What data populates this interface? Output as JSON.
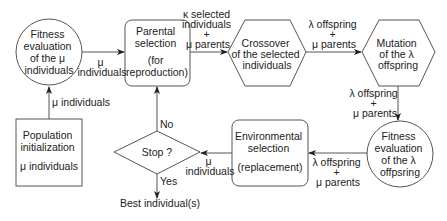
{
  "diagram": {
    "type": "flowchart",
    "nodes": {
      "fitness_mu": {
        "shape": "circle",
        "lines": [
          "Fitness",
          "evaluation",
          "of the μ",
          "individuals"
        ]
      },
      "parental": {
        "shape": "rounded-rect",
        "lines": [
          "Parental",
          "selection",
          "",
          "(for",
          "reproduction)"
        ]
      },
      "crossover": {
        "shape": "hexagon",
        "lines": [
          "Crossover",
          "of the selected",
          "individuals"
        ]
      },
      "mutation": {
        "shape": "hexagon",
        "lines": [
          "Mutation",
          "of the λ",
          "offspring"
        ]
      },
      "fitness_lambda": {
        "shape": "circle",
        "lines": [
          "Fitness",
          "evaluation",
          "of the λ",
          "offpsring"
        ]
      },
      "environmental": {
        "shape": "rounded-rect",
        "lines": [
          "Environmental",
          "selection",
          "",
          "(replacement)"
        ]
      },
      "stop": {
        "shape": "diamond",
        "lines": [
          "Stop ?"
        ]
      },
      "init": {
        "shape": "rect",
        "lines": [
          "Population",
          "initialization",
          "",
          "μ individuals"
        ]
      }
    },
    "edges": {
      "init_to_fitness": {
        "lines": [
          "μ individuals"
        ]
      },
      "fitness_to_parental": {
        "lines": [
          "μ",
          "individuals"
        ]
      },
      "parental_to_crossover": {
        "lines": [
          "κ selected",
          "individuals",
          "+",
          "μ parents"
        ]
      },
      "crossover_to_mutation": {
        "lines": [
          "λ offspring",
          "+",
          "μ parents"
        ]
      },
      "mutation_to_fitness": {
        "lines": [
          "λ offspring",
          "+",
          "μ parents"
        ]
      },
      "fitness_to_environmental": {
        "lines": [
          "λ offspring",
          "+",
          "μ parents"
        ]
      },
      "environmental_to_stop": {
        "lines": [
          "μ",
          "individuals"
        ]
      },
      "stop_no": {
        "lines": [
          "No"
        ]
      },
      "stop_yes": {
        "lines": [
          "Yes"
        ]
      }
    },
    "output": {
      "label": "Best individual(s)"
    }
  }
}
